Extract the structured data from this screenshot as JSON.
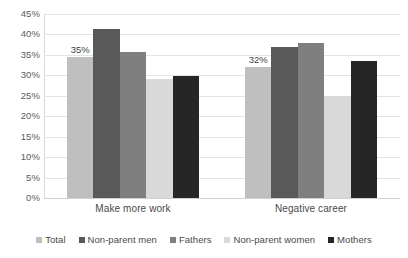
{
  "chart_data": {
    "type": "bar",
    "title": "",
    "subtitle": "",
    "xlabel": "",
    "ylabel": "",
    "categories": [
      "Make more work",
      "Negative career"
    ],
    "series": [
      {
        "name": "Total",
        "color": "#bfbfbf",
        "values": [
          34.5,
          32.0
        ]
      },
      {
        "name": "Non-parent men",
        "color": "#595959",
        "values": [
          41.3,
          37.0
        ]
      },
      {
        "name": "Fathers",
        "color": "#7f7f7f",
        "values": [
          35.6,
          38.0
        ]
      },
      {
        "name": "Non-parent women",
        "color": "#d9d9d9",
        "values": [
          29.1,
          25.0
        ]
      },
      {
        "name": "Mothers",
        "color": "#262626",
        "values": [
          29.8,
          33.5
        ]
      }
    ],
    "data_labels": [
      {
        "category_index": 0,
        "series_index": 0,
        "text": "35%"
      },
      {
        "category_index": 1,
        "series_index": 0,
        "text": "32%"
      }
    ],
    "ylim": [
      0,
      45
    ],
    "ytick_step": 5,
    "ytick_labels": [
      "45%",
      "40%",
      "35%",
      "30%",
      "25%",
      "20%",
      "15%",
      "10%",
      "5%",
      "0%"
    ],
    "ytick_values": [
      45,
      40,
      35,
      30,
      25,
      20,
      15,
      10,
      5,
      0
    ],
    "grid": true,
    "grid_axis": "y",
    "legend_position": "bottom",
    "background_color": "#ffffff",
    "gridline_color": "#e4e4e4",
    "text_color": "#4a4a4a"
  }
}
